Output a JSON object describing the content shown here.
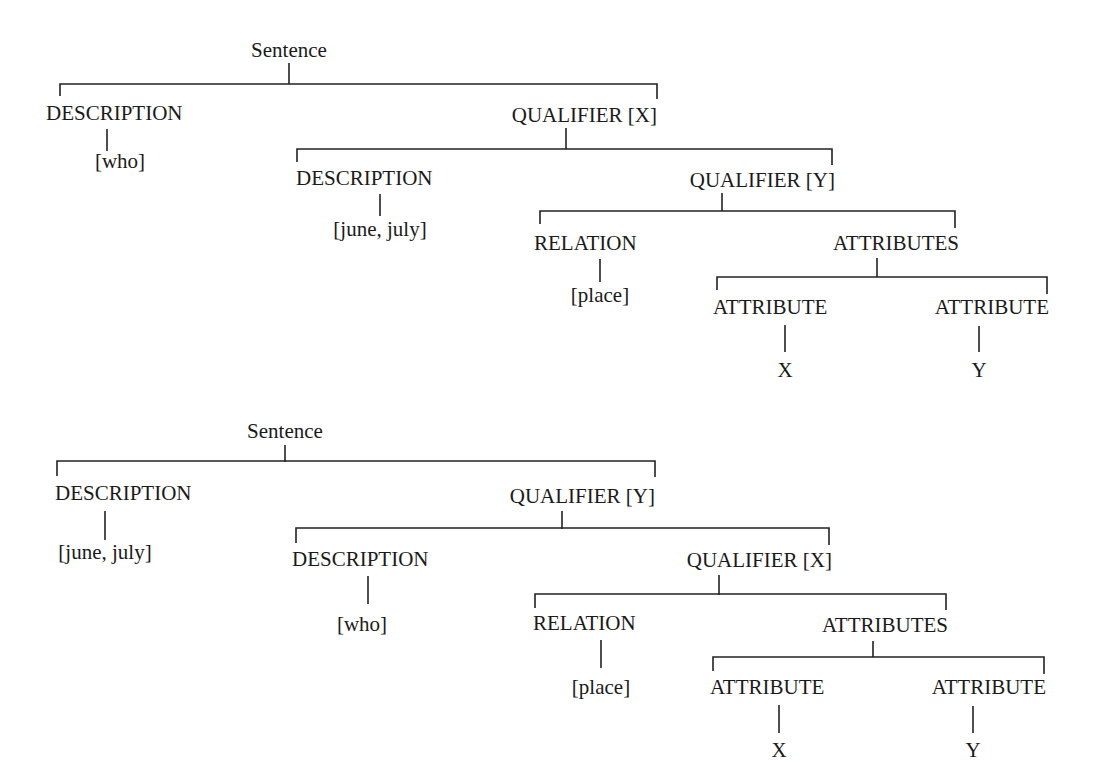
{
  "trees": [
    {
      "name": "tree-1",
      "nodes": {
        "root": "Sentence",
        "desc1": "DESCRIPTION",
        "desc1_value": "[who]",
        "qual1": "QUALIFIER [X]",
        "desc2": "DESCRIPTION",
        "desc2_value": "[june, july]",
        "qual2": "QUALIFIER [Y]",
        "relation": "RELATION",
        "relation_value": "[place]",
        "attributes": "ATTRIBUTES",
        "attr1": "ATTRIBUTE",
        "attr1_value": "X",
        "attr2": "ATTRIBUTE",
        "attr2_value": "Y"
      }
    },
    {
      "name": "tree-2",
      "nodes": {
        "root": "Sentence",
        "desc1": "DESCRIPTION",
        "desc1_value": "[june, july]",
        "qual1": "QUALIFIER [Y]",
        "desc2": "DESCRIPTION",
        "desc2_value": "[who]",
        "qual2": "QUALIFIER [X]",
        "relation": "RELATION",
        "relation_value": "[place]",
        "attributes": "ATTRIBUTES",
        "attr1": "ATTRIBUTE",
        "attr1_value": "X",
        "attr2": "ATTRIBUTE",
        "attr2_value": "Y"
      }
    }
  ]
}
